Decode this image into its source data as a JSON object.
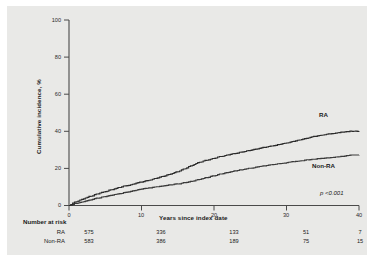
{
  "chart_data": {
    "type": "line",
    "title": "",
    "xlabel": "Years since index date",
    "ylabel": "Cumulative incidence, %",
    "xlim": [
      0,
      40
    ],
    "ylim": [
      0,
      100
    ],
    "xticks": [
      "0",
      "10",
      "20",
      "30",
      "40"
    ],
    "yticks": [
      "0",
      "20",
      "40",
      "60",
      "80",
      "100"
    ],
    "grid": false,
    "legend_position": "inline-curve-labels",
    "annotations": {
      "p_value": "p <0.001",
      "ra_tag": "RA",
      "nonra_tag": "Non-RA"
    },
    "series": [
      {
        "name": "RA",
        "color": "#2b2b2b",
        "x": [
          0,
          1,
          2,
          3,
          4,
          5,
          6,
          7,
          8,
          9,
          10,
          11,
          12,
          13,
          14,
          15,
          16,
          17,
          18,
          19,
          20,
          21,
          22,
          23,
          24,
          25,
          26,
          27,
          28,
          29,
          30,
          31,
          32,
          33,
          34,
          35,
          36,
          37,
          38,
          39,
          40
        ],
        "values": [
          0,
          2.0,
          3.6,
          5.0,
          6.3,
          7.5,
          8.6,
          9.7,
          10.7,
          11.7,
          12.6,
          13.6,
          14.6,
          15.7,
          16.9,
          18.2,
          19.8,
          21.6,
          23.3,
          24.4,
          25.4,
          26.4,
          27.3,
          28.1,
          28.9,
          29.7,
          30.5,
          31.3,
          32.1,
          32.9,
          33.7,
          34.6,
          35.5,
          36.4,
          37.3,
          38.0,
          38.6,
          39.2,
          39.7,
          40.0,
          40.0
        ]
      },
      {
        "name": "Non-RA",
        "color": "#3a3a3a",
        "x": [
          0,
          1,
          2,
          3,
          4,
          5,
          6,
          7,
          8,
          9,
          10,
          11,
          12,
          13,
          14,
          15,
          16,
          17,
          18,
          19,
          20,
          21,
          22,
          23,
          24,
          25,
          26,
          27,
          28,
          29,
          30,
          31,
          32,
          33,
          34,
          35,
          36,
          37,
          38,
          39,
          40
        ],
        "values": [
          0,
          1.1,
          2.1,
          3.0,
          3.9,
          4.8,
          5.6,
          6.4,
          7.2,
          8.0,
          8.8,
          9.5,
          10.1,
          10.6,
          11.1,
          11.6,
          12.3,
          13.1,
          14.0,
          15.0,
          16.0,
          17.0,
          17.9,
          18.7,
          19.4,
          20.1,
          20.8,
          21.4,
          22.0,
          22.6,
          23.1,
          23.6,
          24.1,
          24.6,
          25.0,
          25.4,
          25.8,
          26.2,
          26.6,
          27.2,
          27.2
        ]
      }
    ]
  },
  "risk_table": {
    "title": "Number at risk",
    "rows": [
      {
        "label": "RA",
        "values": [
          "575",
          "336",
          "133",
          "51",
          "7"
        ]
      },
      {
        "label": "Non-RA",
        "values": [
          "583",
          "386",
          "189",
          "75",
          "15"
        ]
      }
    ]
  }
}
